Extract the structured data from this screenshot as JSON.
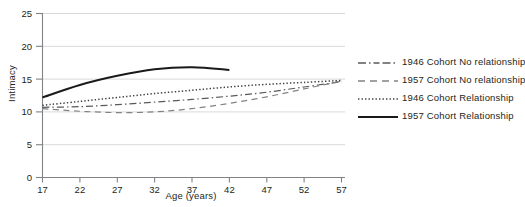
{
  "chart_data": {
    "type": "line",
    "title": "",
    "xlabel": "Age (years)",
    "ylabel": "Intimacy",
    "xlim": [
      17,
      57
    ],
    "ylim": [
      0,
      25
    ],
    "xticks": [
      17,
      22,
      27,
      32,
      37,
      42,
      47,
      52,
      57
    ],
    "yticks": [
      0,
      5,
      10,
      15,
      20,
      25
    ],
    "grid": "horizontal",
    "legend_position": "right",
    "series": [
      {
        "name": "1946 Cohort No relationship",
        "style": "dash-dot",
        "color": "#58595b",
        "x": [
          17,
          22,
          27,
          32,
          37,
          42,
          47,
          52,
          57
        ],
        "values": [
          10.7,
          10.8,
          11.1,
          11.5,
          11.9,
          12.4,
          13.0,
          13.8,
          14.6
        ]
      },
      {
        "name": "1957 Cohort No relationship",
        "style": "dashed",
        "color": "#808285",
        "x": [
          17,
          22,
          27,
          32,
          37,
          42,
          47,
          52,
          57
        ],
        "values": [
          10.5,
          10.1,
          9.9,
          10.0,
          10.5,
          11.3,
          12.3,
          13.5,
          14.7
        ]
      },
      {
        "name": "1946 Cohort Relationship",
        "style": "dotted",
        "color": "#414042",
        "x": [
          17,
          22,
          27,
          32,
          37,
          42,
          47,
          52,
          57
        ],
        "values": [
          11.0,
          11.6,
          12.2,
          12.8,
          13.3,
          13.8,
          14.2,
          14.5,
          14.8
        ]
      },
      {
        "name": "1957 Cohort Relationship",
        "style": "solid",
        "color": "#1a1a1a",
        "x": [
          17,
          22,
          27,
          32,
          37,
          42
        ],
        "values": [
          12.2,
          14.1,
          15.5,
          16.5,
          16.8,
          16.4
        ]
      }
    ]
  },
  "axes": {
    "ylabel": "Intimacy",
    "xlabel": "Age (years)",
    "ytick_labels": [
      "25",
      "20",
      "15",
      "10",
      "5",
      "0"
    ],
    "xtick_labels": [
      "17",
      "22",
      "27",
      "32",
      "37",
      "42",
      "47",
      "52",
      "57"
    ]
  },
  "legend": {
    "items": [
      {
        "label": "1946 Cohort No relationship",
        "style": "dash-dot"
      },
      {
        "label": "1957 Cohort No relationship",
        "style": "dashed"
      },
      {
        "label": "1946 Cohort Relationship",
        "style": "dotted"
      },
      {
        "label": "1957 Cohort Relationship",
        "style": "solid"
      }
    ]
  },
  "colors": {
    "axis": "#808285",
    "grid": "#d9d9d9",
    "text": "#231f20",
    "line_dark": "#1a1a1a"
  }
}
